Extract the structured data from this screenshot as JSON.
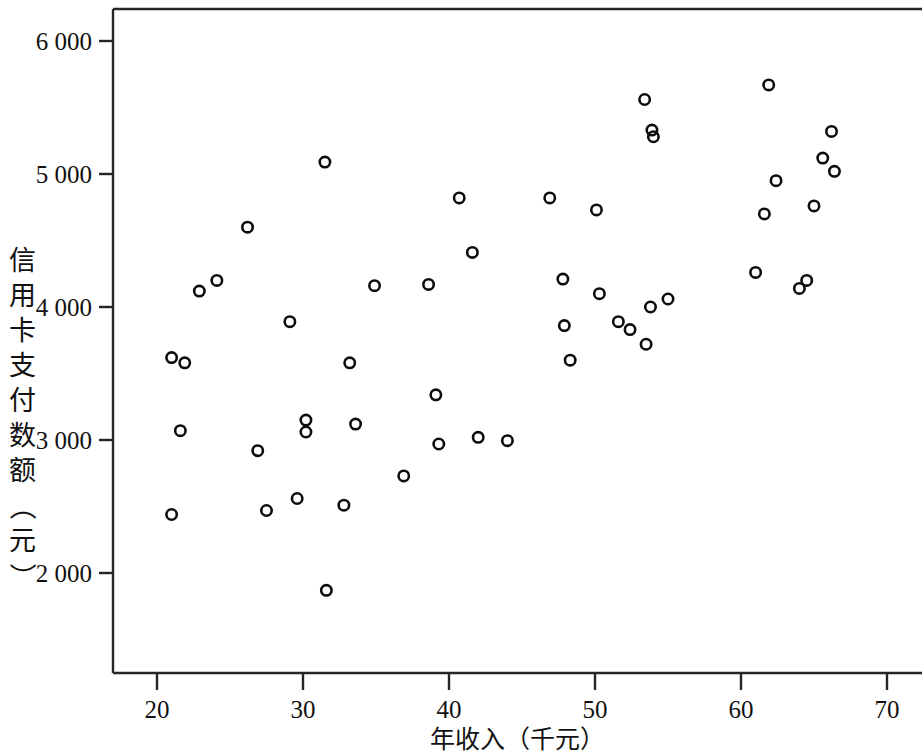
{
  "chart_data": {
    "type": "scatter",
    "title": "",
    "xlabel": "年收入（千元）",
    "ylabel": "信用卡支付数额（元）",
    "ylabel_chars": [
      "信",
      "用",
      "卡",
      "支",
      "付",
      "数",
      "额",
      "（",
      "元",
      "）"
    ],
    "xlim": [
      17.5,
      71.5
    ],
    "ylim": [
      1550,
      6250
    ],
    "xticks": [
      20,
      30,
      40,
      50,
      60,
      70
    ],
    "xtick_labels": [
      "20",
      "30",
      "40",
      "50",
      "60",
      "70"
    ],
    "yticks": [
      2000,
      3000,
      4000,
      5000,
      6000
    ],
    "ytick_labels": [
      "2 000",
      "3 000",
      "4 000",
      "5 000",
      "6 000"
    ],
    "grid": false,
    "legend": null,
    "marker_style": "open-circle",
    "marker_color": "#0d0d0d",
    "n_points": 54,
    "points": [
      {
        "x": 21.0,
        "y": 3620
      },
      {
        "x": 21.0,
        "y": 2440
      },
      {
        "x": 21.6,
        "y": 3070
      },
      {
        "x": 21.9,
        "y": 3580
      },
      {
        "x": 22.9,
        "y": 4120
      },
      {
        "x": 24.1,
        "y": 4200
      },
      {
        "x": 26.2,
        "y": 4600
      },
      {
        "x": 26.9,
        "y": 2920
      },
      {
        "x": 27.5,
        "y": 2470
      },
      {
        "x": 29.1,
        "y": 3890
      },
      {
        "x": 29.6,
        "y": 2560
      },
      {
        "x": 30.2,
        "y": 3150
      },
      {
        "x": 30.2,
        "y": 3060
      },
      {
        "x": 31.5,
        "y": 5090
      },
      {
        "x": 31.6,
        "y": 1870
      },
      {
        "x": 32.8,
        "y": 2510
      },
      {
        "x": 33.2,
        "y": 3580
      },
      {
        "x": 33.6,
        "y": 3120
      },
      {
        "x": 34.9,
        "y": 4160
      },
      {
        "x": 36.9,
        "y": 2730
      },
      {
        "x": 38.6,
        "y": 4170
      },
      {
        "x": 39.1,
        "y": 3340
      },
      {
        "x": 39.3,
        "y": 2970
      },
      {
        "x": 40.7,
        "y": 4820
      },
      {
        "x": 41.6,
        "y": 4410
      },
      {
        "x": 42.0,
        "y": 3020
      },
      {
        "x": 44.0,
        "y": 2995
      },
      {
        "x": 46.9,
        "y": 4820
      },
      {
        "x": 47.8,
        "y": 4210
      },
      {
        "x": 47.9,
        "y": 3860
      },
      {
        "x": 48.3,
        "y": 3600
      },
      {
        "x": 50.1,
        "y": 4730
      },
      {
        "x": 50.3,
        "y": 4100
      },
      {
        "x": 51.6,
        "y": 3890
      },
      {
        "x": 52.4,
        "y": 3830
      },
      {
        "x": 53.4,
        "y": 5560
      },
      {
        "x": 53.5,
        "y": 3720
      },
      {
        "x": 53.8,
        "y": 4000
      },
      {
        "x": 53.9,
        "y": 5330
      },
      {
        "x": 54.0,
        "y": 5280
      },
      {
        "x": 55.0,
        "y": 4060
      },
      {
        "x": 61.0,
        "y": 4260
      },
      {
        "x": 61.6,
        "y": 4700
      },
      {
        "x": 61.9,
        "y": 5670
      },
      {
        "x": 62.4,
        "y": 4950
      },
      {
        "x": 64.0,
        "y": 4140
      },
      {
        "x": 64.5,
        "y": 4200
      },
      {
        "x": 65.0,
        "y": 4760
      },
      {
        "x": 65.6,
        "y": 5120
      },
      {
        "x": 66.2,
        "y": 5320
      },
      {
        "x": 66.4,
        "y": 5020
      }
    ]
  },
  "axis_colors": {
    "axis": "#262626",
    "marker": "#0d0d0d",
    "text": "#111111"
  }
}
